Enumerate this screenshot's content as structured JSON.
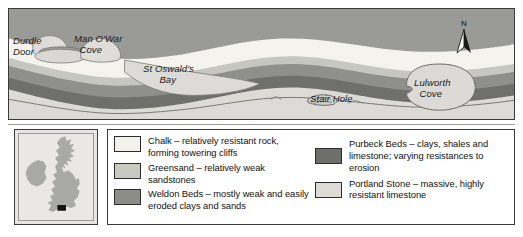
{
  "map": {
    "title": "Lulworth Cove and Durdle Door geology map",
    "compass": {
      "label": "N",
      "icon": "north-arrow-icon"
    },
    "sea_color": "#dddcd8",
    "labels": [
      {
        "id": "durdle",
        "text": "Durdle\nDoor"
      },
      {
        "id": "manowar",
        "text": "Man O'War\n  Cove"
      },
      {
        "id": "stoswald",
        "text": "St Oswald's\n      Bay"
      },
      {
        "id": "stair",
        "text": "Stair Hole"
      },
      {
        "id": "lulworth",
        "text": "Lulworth\n  Cove"
      }
    ]
  },
  "inset": {
    "name": "british-isles-locator",
    "land_color": "#a8a8a4",
    "marker_color": "#1a1a1a"
  },
  "legend": {
    "columns": [
      {
        "items": [
          {
            "name": "chalk",
            "color": "#f2f1ec",
            "text": "Chalk – relatively resistant rock, forming towering cliffs"
          },
          {
            "name": "greensand",
            "color": "#c9c9c4",
            "text": "Greensand – relatively weak sandstones"
          },
          {
            "name": "weldon-beds",
            "color": "#8c8c88",
            "text": "Weldon Beds – mostly weak and easily eroded clays and sands"
          }
        ]
      },
      {
        "items": [
          {
            "name": "purbeck-beds",
            "color": "#6e6e6b",
            "text": "Purbeck Beds – clays, shales and limestone; varying resistances to erosion"
          },
          {
            "name": "portland-stone",
            "color": "#dcdbd6",
            "text": "Portland Stone – massive, highly resistant limestone"
          }
        ]
      }
    ]
  }
}
